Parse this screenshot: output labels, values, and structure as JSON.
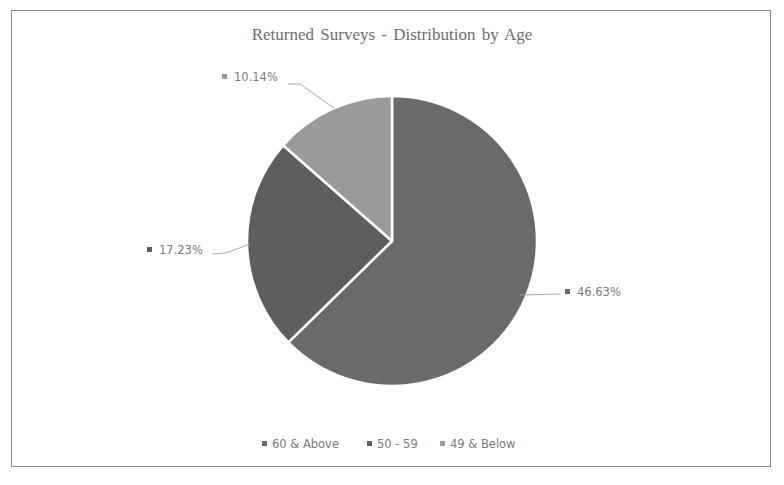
{
  "chart_data": {
    "type": "pie",
    "title": "Returned Surveys - Distribution by Age",
    "categories": [
      "60 & Above",
      "50 - 59",
      "49 & Below"
    ],
    "values": [
      46.63,
      17.23,
      10.14
    ],
    "value_labels": [
      "46.63%",
      "17.23%",
      "10.14%"
    ],
    "unit": "%",
    "slice_angles_deg": [
      225.6,
      85.7,
      48.7
    ],
    "colors": [
      "#6a6a6a",
      "#5e5e5e",
      "#9a9a9a"
    ],
    "legend_position": "bottom",
    "data_labels": "outside with leader lines"
  },
  "title": "Returned Surveys - Distribution by Age",
  "labels": {
    "a": "46.63%",
    "b": "17.23%",
    "c": "10.14%"
  },
  "legend": {
    "items": [
      {
        "label": "60 & Above",
        "color": "#6a6a6a"
      },
      {
        "label": "50 - 59",
        "color": "#5e5e5e"
      },
      {
        "label": "49 & Below",
        "color": "#9a9a9a"
      }
    ]
  }
}
